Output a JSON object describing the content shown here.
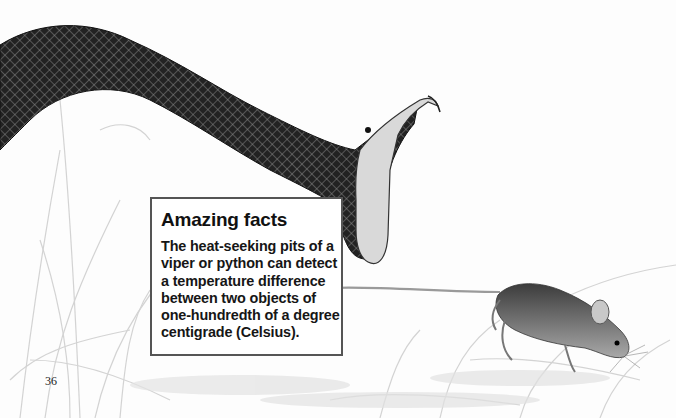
{
  "page": {
    "number": "36",
    "background": "#fdfdfd"
  },
  "illustration": {
    "subjects": [
      "snake",
      "mouse",
      "grass"
    ],
    "snake": {
      "description": "viper-like snake with open mouth and fangs",
      "color": "#1c1c1c"
    },
    "mouse": {
      "description": "mouse with long tail walking on ground",
      "color": "#6b6b6b"
    }
  },
  "fact_box": {
    "title": "Amazing facts",
    "lines": [
      "The heat-seeking pits of a",
      "viper or python can detect",
      "a temperature difference",
      "between two objects of",
      "one-hundredth of a degree",
      "centigrade (Celsius)."
    ],
    "border_color": "#555555"
  }
}
